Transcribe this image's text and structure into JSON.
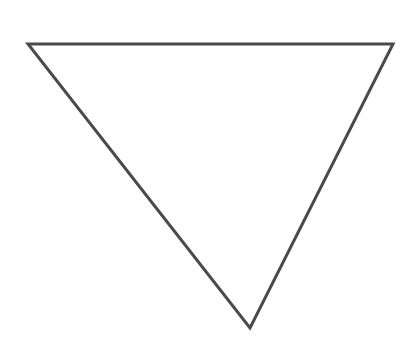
{
  "diagram": {
    "shape": "inverted-triangle",
    "stroke_color": "#4a4a4a",
    "stroke_width": 3,
    "fill_color": "#ffffff",
    "background": "#ffffff",
    "vertices": {
      "top_left": [
        28,
        44
      ],
      "top_right": [
        393,
        44
      ],
      "bottom": [
        250,
        328
      ]
    },
    "points": "28,44 393,44 250,328"
  }
}
